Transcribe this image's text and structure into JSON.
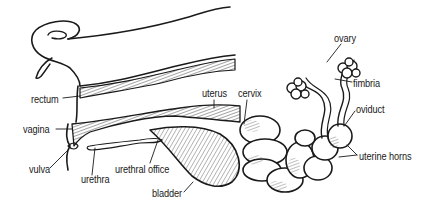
{
  "diagram": {
    "labels": [
      {
        "id": "rectum",
        "text": "rectum",
        "x": 31,
        "y": 95
      },
      {
        "id": "vagina",
        "text": "vagina",
        "x": 23,
        "y": 125
      },
      {
        "id": "vulva",
        "text": "vulva",
        "x": 29,
        "y": 165
      },
      {
        "id": "urethra",
        "text": "urethra",
        "x": 81,
        "y": 175
      },
      {
        "id": "urethral-office",
        "text": "urethral office",
        "x": 115,
        "y": 165
      },
      {
        "id": "bladder",
        "text": "bladder",
        "x": 152,
        "y": 189
      },
      {
        "id": "uterus",
        "text": "uterus",
        "x": 202,
        "y": 89
      },
      {
        "id": "cervix",
        "text": "cervix",
        "x": 238,
        "y": 89
      },
      {
        "id": "ovary",
        "text": "ovary",
        "x": 334,
        "y": 34
      },
      {
        "id": "fimbria",
        "text": "fimbria",
        "x": 353,
        "y": 79
      },
      {
        "id": "oviduct",
        "text": "oviduct",
        "x": 356,
        "y": 108
      },
      {
        "id": "uterine-horns",
        "text": "uterine horns",
        "x": 359,
        "y": 152
      }
    ],
    "colors": {
      "ink": "#1a1a1a",
      "background": "#ffffff"
    }
  }
}
